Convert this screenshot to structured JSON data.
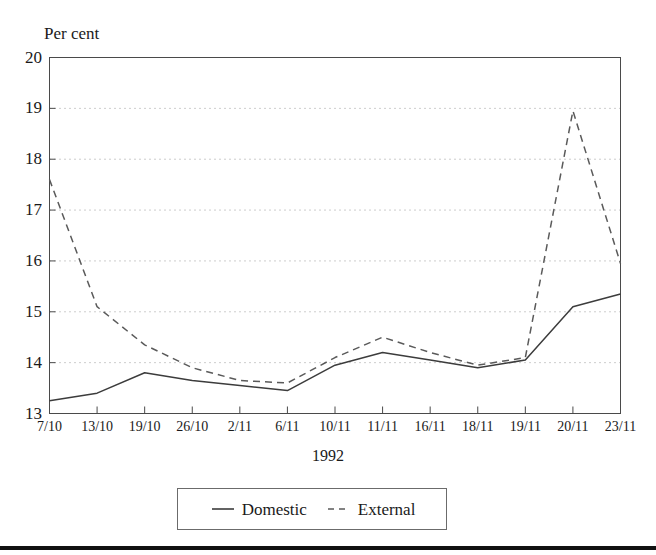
{
  "chart_data": {
    "type": "line",
    "title": "",
    "ylabel": "Per cent",
    "xlabel": "1992",
    "ylim": [
      13,
      20
    ],
    "yticks": [
      13,
      14,
      15,
      16,
      17,
      18,
      19,
      20
    ],
    "grid": true,
    "legend_position": "bottom-center",
    "categories": [
      "7/10",
      "13/10",
      "19/10",
      "26/10",
      "2/11",
      "6/11",
      "10/11",
      "11/11",
      "16/11",
      "18/11",
      "19/11",
      "20/11",
      "23/11"
    ],
    "series": [
      {
        "name": "Domestic",
        "style": "solid",
        "color": "#3c3c3c",
        "values": [
          13.25,
          13.4,
          13.8,
          13.65,
          13.55,
          13.45,
          13.95,
          14.2,
          14.05,
          13.9,
          14.05,
          15.1,
          15.35
        ]
      },
      {
        "name": "External",
        "style": "dashed",
        "color": "#5a5a5a",
        "values": [
          17.6,
          15.1,
          14.35,
          13.9,
          13.65,
          13.6,
          14.1,
          14.5,
          14.2,
          13.95,
          14.1,
          18.95,
          15.95
        ]
      }
    ]
  },
  "legend": {
    "items": [
      {
        "label": "Domestic",
        "icon": "solid-line-swatch"
      },
      {
        "label": "External",
        "icon": "dashed-line-swatch"
      }
    ]
  },
  "colors": {
    "axis": "#4a4a4a",
    "grid": "#9a9a9a",
    "domestic": "#3c3c3c",
    "external": "#5a5a5a",
    "text": "#1a1a1a",
    "rule": "#111111"
  }
}
